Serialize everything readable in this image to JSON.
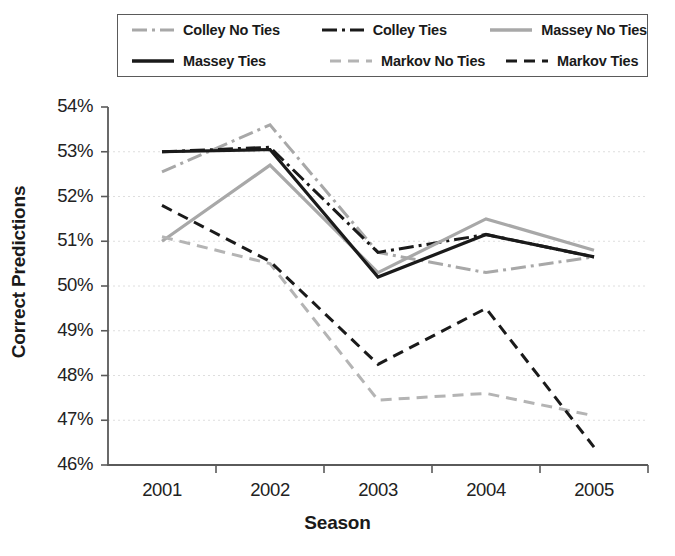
{
  "chart_data": {
    "type": "line",
    "title": "",
    "xlabel": "Season",
    "ylabel": "Correct Predictions",
    "categories": [
      "2001",
      "2002",
      "2003",
      "2004",
      "2005"
    ],
    "x": [
      2001,
      2002,
      2003,
      2004,
      2005
    ],
    "ylim": [
      46,
      54
    ],
    "yticks": [
      "46%",
      "47%",
      "48%",
      "49%",
      "50%",
      "51%",
      "52%",
      "53%",
      "54%"
    ],
    "ytick_values": [
      46,
      47,
      48,
      49,
      50,
      51,
      52,
      53,
      54
    ],
    "xticks": [
      "2001",
      "2002",
      "2003",
      "2004",
      "2005"
    ],
    "grid": true,
    "legend_position": "top",
    "units": "percent",
    "series": [
      {
        "name": "Colley No Ties",
        "style": "dash-dot",
        "color": "#a8a8a8",
        "values": [
          52.55,
          53.6,
          50.75,
          50.3,
          50.65
        ]
      },
      {
        "name": "Colley Ties",
        "style": "dash-dot",
        "color": "#1a1a1a",
        "values": [
          53.0,
          53.1,
          50.75,
          51.15,
          50.65
        ]
      },
      {
        "name": "Massey No Ties",
        "style": "solid",
        "color": "#a8a8a8",
        "values": [
          51.0,
          52.7,
          50.3,
          51.5,
          50.8
        ]
      },
      {
        "name": "Massey Ties",
        "style": "solid",
        "color": "#1a1a1a",
        "values": [
          53.0,
          53.05,
          50.2,
          51.15,
          50.65
        ]
      },
      {
        "name": "Markov No Ties",
        "style": "dashed",
        "color": "#b4b4b4",
        "values": [
          51.1,
          50.5,
          47.45,
          47.6,
          47.1
        ]
      },
      {
        "name": "Markov Ties",
        "style": "dashed",
        "color": "#1a1a1a",
        "values": [
          51.8,
          50.55,
          48.25,
          49.5,
          46.4
        ]
      }
    ]
  },
  "legend": {
    "items": [
      {
        "label": "Colley No Ties",
        "style": "dash-dot",
        "color": "#a8a8a8"
      },
      {
        "label": "Colley Ties",
        "style": "dash-dot",
        "color": "#1a1a1a"
      },
      {
        "label": "Massey No Ties",
        "style": "solid",
        "color": "#a8a8a8"
      },
      {
        "label": "Massey Ties",
        "style": "solid",
        "color": "#1a1a1a"
      },
      {
        "label": "Markov No Ties",
        "style": "dashed",
        "color": "#b4b4b4"
      },
      {
        "label": "Markov Ties",
        "style": "dashed",
        "color": "#1a1a1a"
      }
    ]
  },
  "axes": {
    "axis_color": "#5a5a5a",
    "grid_color": "#dedede"
  }
}
